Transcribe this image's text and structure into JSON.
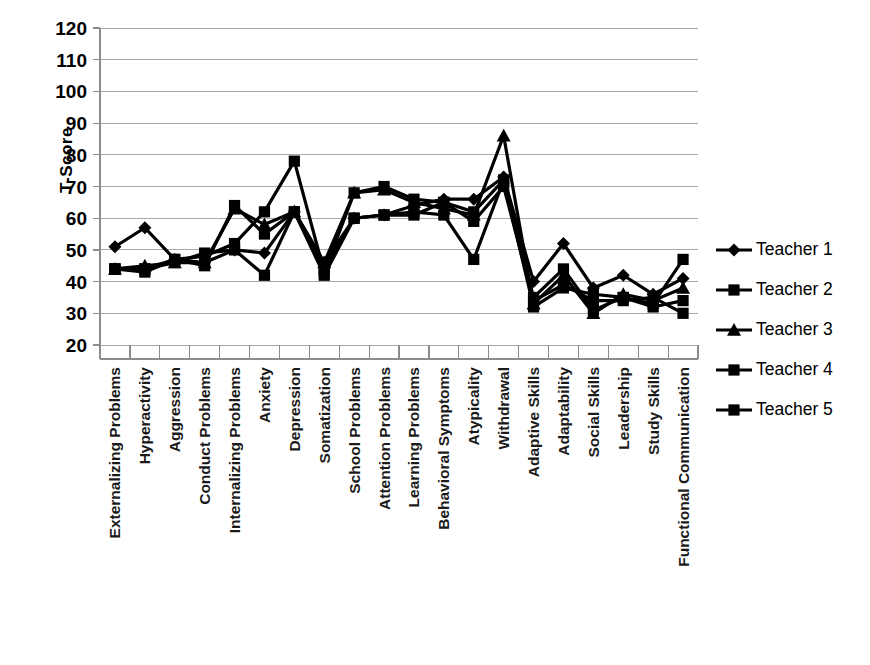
{
  "chart_data": {
    "type": "line",
    "title": "",
    "xlabel": "",
    "ylabel": "T-Score",
    "ylim": [
      20,
      120
    ],
    "ytick_step": 10,
    "yticks": [
      120,
      110,
      100,
      90,
      80,
      70,
      60,
      50,
      40,
      30,
      20
    ],
    "grid": true,
    "legend_position": "right",
    "categories": [
      "Externalizing Problems",
      "Hyperactivity",
      "Aggression",
      "Conduct Problems",
      "Internalizing Problems",
      "Anxiety",
      "Depression",
      "Somatization",
      "School Problems",
      "Attention Problems",
      "Learning Problems",
      "Behavioral Symptoms",
      "Atypicality",
      "Withdrawal",
      "Adaptive Skills",
      "Adaptability",
      "Social Skills",
      "Leadership",
      "Study Skills",
      "Functional Communication"
    ],
    "series": [
      {
        "name": "Teacher 1",
        "marker": "diamond",
        "color": "#000000",
        "values": [
          51,
          57,
          47,
          46,
          50,
          49,
          62,
          46,
          60,
          61,
          64,
          66,
          66,
          73,
          40,
          52,
          38,
          42,
          36,
          41
        ]
      },
      {
        "name": "Teacher 2",
        "marker": "square",
        "color": "#000000",
        "values": [
          44,
          43,
          47,
          48,
          52,
          62,
          78,
          43,
          68,
          70,
          66,
          65,
          62,
          72,
          32,
          38,
          36,
          35,
          33,
          47
        ]
      },
      {
        "name": "Teacher 3",
        "marker": "triangle",
        "color": "#000000",
        "values": [
          44,
          45,
          46,
          46,
          63,
          58,
          62,
          46,
          68,
          69,
          65,
          63,
          61,
          86,
          33,
          42,
          30,
          36,
          34,
          38
        ]
      },
      {
        "name": "Teacher 4",
        "marker": "square",
        "color": "#000000",
        "values": [
          44,
          44,
          47,
          45,
          64,
          55,
          62,
          44,
          60,
          61,
          62,
          61,
          47,
          72,
          35,
          44,
          31,
          35,
          32,
          34
        ]
      },
      {
        "name": "Teacher 5",
        "marker": "square",
        "color": "#000000",
        "values": [
          44,
          44,
          46,
          49,
          50,
          42,
          62,
          42,
          60,
          61,
          61,
          65,
          59,
          70,
          34,
          39,
          34,
          34,
          35,
          30
        ]
      }
    ]
  },
  "legend": {
    "entries": [
      {
        "label": "Teacher 1",
        "marker": "diamond"
      },
      {
        "label": "Teacher 2",
        "marker": "square"
      },
      {
        "label": "Teacher 3",
        "marker": "triangle"
      },
      {
        "label": "Teacher 4",
        "marker": "square"
      },
      {
        "label": "Teacher 5",
        "marker": "square"
      }
    ]
  }
}
